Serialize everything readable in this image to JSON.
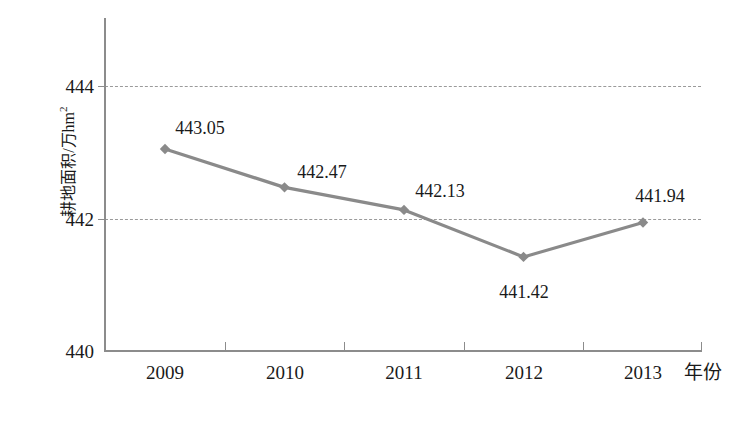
{
  "chart_data": {
    "type": "line",
    "title": "",
    "subtitle": "",
    "xlabel": "年份",
    "ylabel": "耕地面积/万hm²",
    "ylabel_main": "耕地面积/万hm",
    "ylabel_sup": "2",
    "categories": [
      "2009",
      "2010",
      "2011",
      "2012",
      "2013"
    ],
    "values": [
      443.05,
      442.47,
      442.13,
      441.42,
      441.94
    ],
    "point_labels": [
      "443.05",
      "442.47",
      "442.13",
      "441.42",
      "441.94"
    ],
    "series": [
      {
        "name": "耕地面积",
        "values": [
          443.05,
          442.47,
          442.13,
          441.42,
          441.94
        ]
      }
    ],
    "ylim": [
      440,
      444.8
    ],
    "yticks": [
      440,
      442,
      444
    ],
    "ytick_labels": [
      "440",
      "442",
      "444"
    ],
    "xlim": [
      "2009",
      "2013"
    ],
    "grid": "horizontal-dashed",
    "legend": "none",
    "marker": "diamond",
    "colors": {
      "line": "#8a8a8a",
      "marker": "#8a8a8a",
      "axis": "#8c8c8c",
      "gridline": "#9a9a9a",
      "text": "#1a1a1a",
      "background": "#ffffff"
    }
  },
  "axes": {
    "y": {
      "ticks": [
        {
          "label": "444",
          "value": 444
        },
        {
          "label": "442",
          "value": 442
        },
        {
          "label": "440",
          "value": 440
        }
      ]
    },
    "x": {
      "ticks": [
        {
          "label": "2009"
        },
        {
          "label": "2010"
        },
        {
          "label": "2011"
        },
        {
          "label": "2012"
        },
        {
          "label": "2013"
        }
      ],
      "title": "年份"
    }
  }
}
